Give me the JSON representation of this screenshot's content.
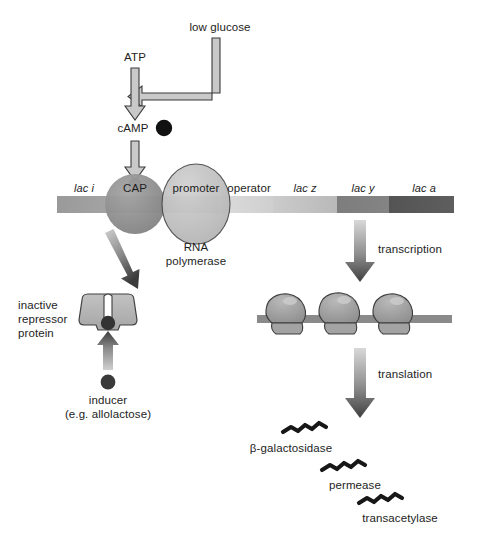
{
  "figure": {
    "background": "#ffffff",
    "text_color": "#1d1d1d"
  },
  "palette": {
    "dna_bar_light": "#d8d8d8",
    "dna_bar_mid": "#a8a8a8",
    "dna_bar_dark": "#6f6f6f",
    "dna_bar_darkest": "#565656",
    "cap_fill": "#8e8e8e",
    "polymerase_fill": "#bdbdbd",
    "hollow_arrow_fill": "#c9c9c9",
    "solid_arrow_light": "#d2d2d2",
    "solid_arrow_dark": "#4a4a4a",
    "repressor_fill": "#b4b4b4",
    "ribosome_fill": "#9d9d9d",
    "dot_black": "#111111",
    "outline": "#3a3a3a"
  },
  "pathway": {
    "low_glucose_label": "low glucose",
    "atp_label": "ATP",
    "camp_label": "cAMP",
    "camp_molecule_name": "cAMP-molecule-dot"
  },
  "operon": {
    "cap_label": "CAP",
    "promoter_label": "promoter",
    "operator_label": "operator",
    "rna_polymerase_label_line1": "RNA",
    "rna_polymerase_label_line2": "polymerase",
    "genes": [
      {
        "label": "lac i",
        "name": "gene-lac-i"
      },
      {
        "label": "lac z",
        "name": "gene-lac-z"
      },
      {
        "label": "lac y",
        "name": "gene-lac-y"
      },
      {
        "label": "lac a",
        "name": "gene-lac-a"
      }
    ]
  },
  "repressor": {
    "label_line1": "inactive",
    "label_line2": "repressor",
    "label_line3": "protein",
    "label_full": "inactive\nrepressor\nprotein"
  },
  "inducer": {
    "label_line1": "inducer",
    "label_line2": "(e.g. allolactose)",
    "label_full": "inducer\n(e.g. allolactose)"
  },
  "processes": {
    "transcription_label": "transcription",
    "translation_label": "translation"
  },
  "products": [
    {
      "label": "β-galactosidase",
      "name": "product-beta-galactosidase"
    },
    {
      "label": "permease",
      "name": "product-permease"
    },
    {
      "label": "transacetylase",
      "name": "product-transacetylase"
    }
  ]
}
